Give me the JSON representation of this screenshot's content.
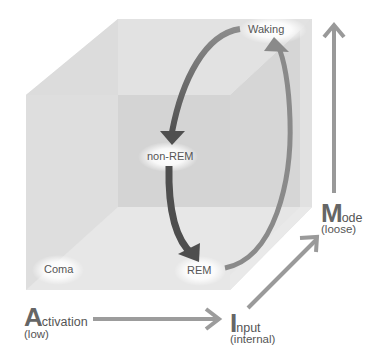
{
  "diagram": {
    "states": [
      {
        "id": "waking",
        "label": "Waking"
      },
      {
        "id": "non-rem",
        "label": "non-REM"
      },
      {
        "id": "rem",
        "label": "REM"
      },
      {
        "id": "coma",
        "label": "Coma"
      }
    ],
    "axes": [
      {
        "id": "activation",
        "initial": "A",
        "rest": "ctivation",
        "qualifier": "(low)"
      },
      {
        "id": "input",
        "initial": "I",
        "rest": "nput",
        "qualifier": "(internal)"
      },
      {
        "id": "mode",
        "initial": "M",
        "rest": "ode",
        "qualifier": "(loose)"
      }
    ],
    "cycle": [
      "Waking",
      "non-REM",
      "REM",
      "Waking"
    ],
    "colors": {
      "cube_face": "#e3e3e3",
      "cube_back": "#d2d2d2",
      "arrow_dark": "#5a5a5a",
      "arrow_light": "#8a8a8a",
      "axis_arrow": "#999999",
      "text": "#555555"
    }
  }
}
